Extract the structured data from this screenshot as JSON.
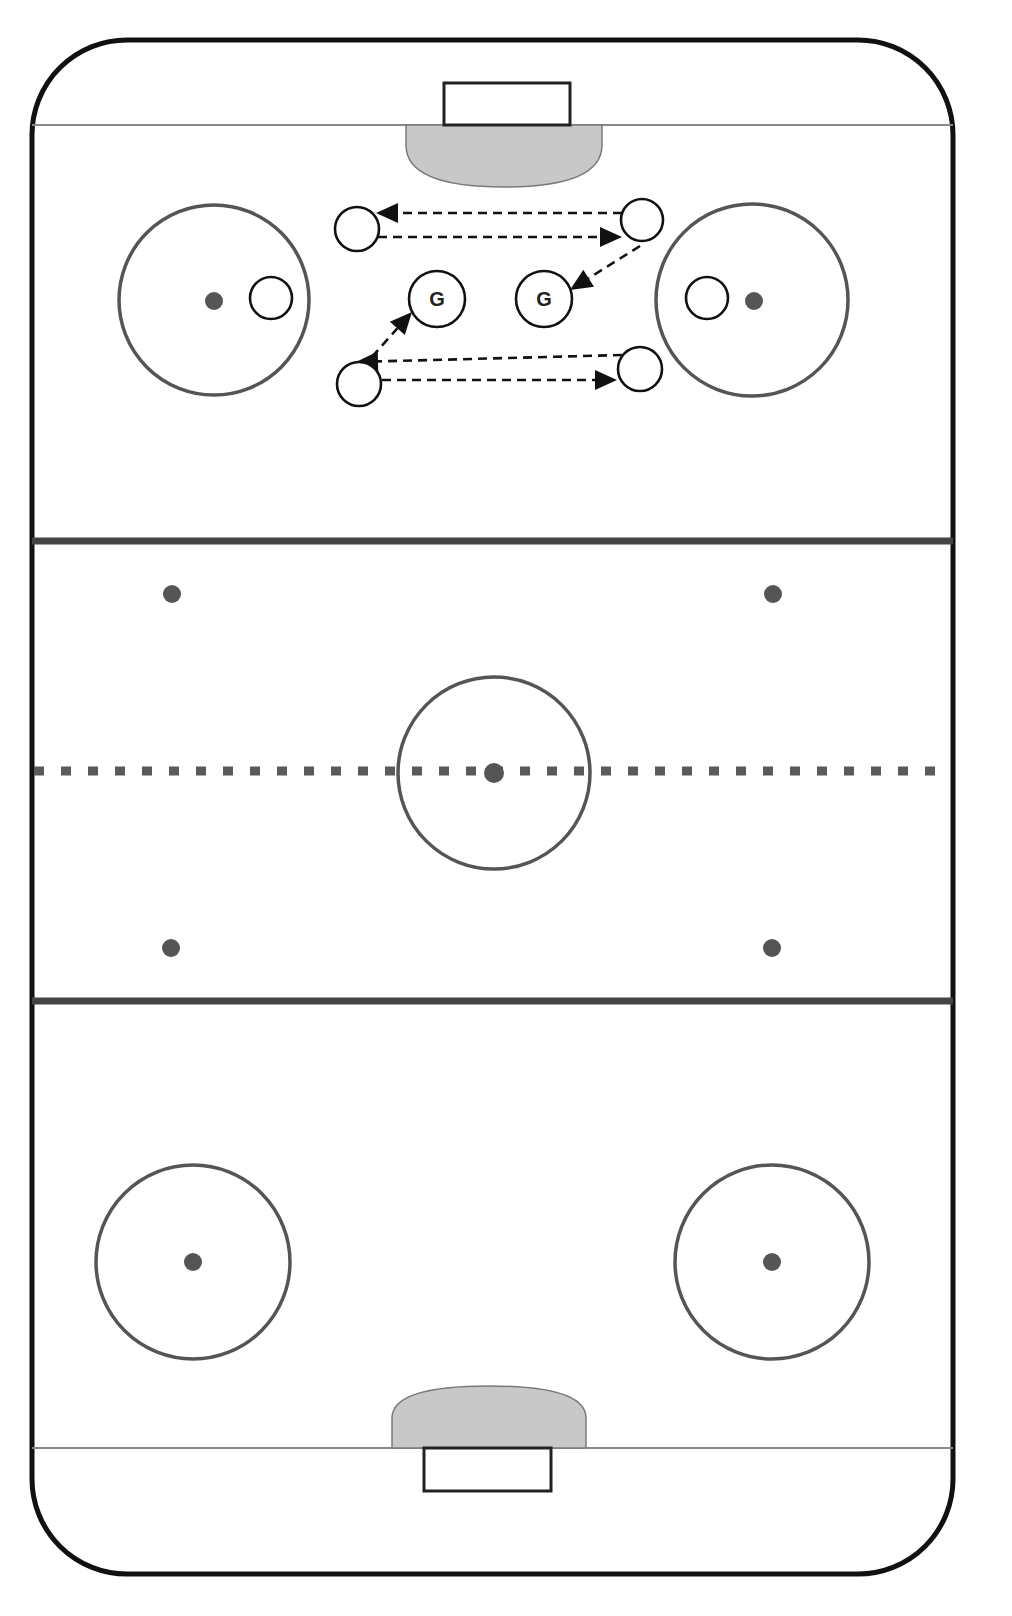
{
  "diagram": {
    "type": "hockey-drill",
    "colors": {
      "boards": "#111111",
      "blue_line": "#444444",
      "red_line": "#5a5a5a",
      "crease": "#c8c8c8",
      "faceoff": "#555555",
      "player_outline": "#111111"
    },
    "rink": {
      "left": 32,
      "right": 953,
      "top": 40,
      "bottom": 1574,
      "corner_radius": 95,
      "top_goal_line_y": 125,
      "bottom_goal_line_y": 1448,
      "blue_lines_y": [
        541,
        1001
      ],
      "red_line_y": 771
    },
    "goals": {
      "top": {
        "net": {
          "x": 444,
          "y": 83,
          "w": 126,
          "h": 42
        },
        "crease": {
          "x": 406,
          "y": 125,
          "w": 196,
          "h": 62
        }
      },
      "bottom": {
        "net": {
          "x": 424,
          "y": 1448,
          "w": 127,
          "h": 43
        },
        "crease": {
          "x": 392,
          "y": 1386,
          "w": 194,
          "h": 62
        }
      }
    },
    "faceoff_circles": [
      {
        "name": "top-left",
        "cx": 214,
        "cy": 300,
        "r": 95,
        "dot_cx": 214,
        "dot_cy": 301
      },
      {
        "name": "top-right",
        "cx": 752,
        "cy": 300,
        "r": 96,
        "dot_cx": 754,
        "dot_cy": 301
      },
      {
        "name": "center",
        "cx": 494,
        "cy": 773,
        "r": 96,
        "dot_cx": 494,
        "dot_cy": 773
      },
      {
        "name": "bottom-left",
        "cx": 193,
        "cy": 1262,
        "r": 97,
        "dot_cx": 193,
        "dot_cy": 1262
      },
      {
        "name": "bottom-right",
        "cx": 772,
        "cy": 1262,
        "r": 97,
        "dot_cx": 772,
        "dot_cy": 1262
      }
    ],
    "neutral_zone_dots": [
      {
        "cx": 172,
        "cy": 594
      },
      {
        "cx": 773,
        "cy": 594
      },
      {
        "cx": 171,
        "cy": 948
      },
      {
        "cx": 772,
        "cy": 948
      }
    ],
    "players": [
      {
        "id": "p1",
        "label": "",
        "cx": 271,
        "cy": 298,
        "r": 21
      },
      {
        "id": "p2",
        "label": "",
        "cx": 707,
        "cy": 298,
        "r": 21
      },
      {
        "id": "p3",
        "label": "",
        "cx": 357,
        "cy": 229,
        "r": 22
      },
      {
        "id": "p4",
        "label": "",
        "cx": 642,
        "cy": 220,
        "r": 21
      },
      {
        "id": "p5",
        "label": "",
        "cx": 359,
        "cy": 384,
        "r": 22
      },
      {
        "id": "p6",
        "label": "",
        "cx": 640,
        "cy": 369,
        "r": 22
      }
    ],
    "goalies": [
      {
        "id": "g1",
        "label": "G",
        "cx": 437,
        "cy": 299,
        "r": 28
      },
      {
        "id": "g2",
        "label": "G",
        "cx": 544,
        "cy": 299,
        "r": 28
      }
    ],
    "passes": [
      {
        "from": [
          622,
          213
        ],
        "to": [
          376,
          213
        ]
      },
      {
        "from": [
          378,
          237
        ],
        "to": [
          622,
          237
        ]
      },
      {
        "from": [
          640,
          246
        ],
        "to": [
          570,
          290
        ]
      },
      {
        "from": [
          622,
          355
        ],
        "to": [
          356,
          362
        ]
      },
      {
        "from": [
          382,
          380
        ],
        "to": [
          617,
          380
        ]
      },
      {
        "from": [
          362,
          368
        ],
        "to": [
          412,
          312
        ]
      }
    ]
  }
}
